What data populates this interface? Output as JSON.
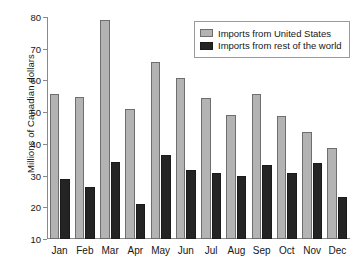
{
  "chart_data": {
    "type": "bar",
    "title": "",
    "xlabel": "",
    "ylabel": "Millions of Canadian dollars",
    "ylim": [
      10,
      80
    ],
    "ytick_values": [
      10,
      20,
      30,
      40,
      50,
      60,
      70,
      80
    ],
    "ytick_labels": [
      "10",
      "20",
      "30",
      "40",
      "50",
      "60",
      "70",
      "80"
    ],
    "grid": false,
    "legend_position": "top-right",
    "categories": [
      "Jan",
      "Feb",
      "Mar",
      "Apr",
      "May",
      "Jun",
      "Jul",
      "Aug",
      "Sep",
      "Oct",
      "Nov",
      "Dec"
    ],
    "series": [
      {
        "name": "Imports from United States",
        "color": "#b3b3b3",
        "values": [
          55.8,
          54.8,
          79.2,
          51.1,
          65.7,
          60.7,
          54.4,
          49.2,
          55.8,
          48.9,
          43.8,
          38.6
        ]
      },
      {
        "name": "Imports from rest of the world",
        "color": "#242424",
        "values": [
          29.0,
          26.4,
          34.4,
          21.0,
          36.4,
          31.8,
          30.9,
          29.9,
          33.3,
          30.8,
          33.9,
          23.4
        ]
      }
    ]
  },
  "legend": {
    "items": [
      {
        "label": "Imports from United States",
        "swatch": "us"
      },
      {
        "label": "Imports from rest of the world",
        "swatch": "row"
      }
    ]
  }
}
